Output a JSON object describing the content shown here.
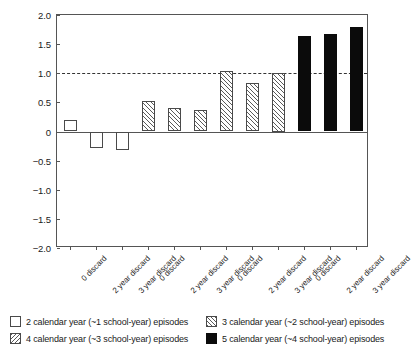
{
  "chart_data": {
    "type": "bar",
    "title": "",
    "subtitle": "",
    "xlabel": "",
    "ylabel": "",
    "ylim": [
      -2.0,
      2.0
    ],
    "ytick_labels": [
      "2.0",
      "1.5",
      "1.0",
      "0.5",
      "0",
      "-0.5",
      "-1.0",
      "-1.5",
      "-2.0"
    ],
    "ytick_values": [
      2.0,
      1.5,
      1.0,
      0.5,
      0,
      -0.5,
      -1.0,
      -1.5,
      -2.0
    ],
    "grid": false,
    "reference_line": {
      "value": 1.0,
      "style": "dashed",
      "color": "#333333"
    },
    "zero_line": {
      "value": 0,
      "style": "solid",
      "color": "#555555"
    },
    "legend_position": "below-plot",
    "categories": [
      "0 discard",
      "2 year discard",
      "3 year discard",
      "0 discard",
      "2 year discard",
      "3 year discard",
      "0 discard",
      "2 year discard",
      "3 year discard",
      "0 discard",
      "2 year discard",
      "3 year discard"
    ],
    "values": [
      0.19,
      -0.29,
      -0.31,
      0.52,
      0.4,
      0.37,
      1.04,
      0.83,
      1.0,
      1.64,
      1.68,
      1.79
    ],
    "bar_styles": [
      "empty",
      "empty",
      "empty",
      "hatch",
      "hatch",
      "hatch",
      "hatch",
      "hatch",
      "hatch",
      "solid",
      "solid",
      "solid"
    ],
    "groups": [
      {
        "name": "2 calendar year (~1 school-year) episodes",
        "style": "empty",
        "indices": [
          0,
          1,
          2
        ]
      },
      {
        "name": "3 calendar year (~2 school-year) episodes",
        "style": "hatch-up",
        "indices": [
          3,
          4,
          5
        ]
      },
      {
        "name": "4 calendar year (~3 school-year) episodes",
        "style": "hatch-down",
        "indices": [
          6,
          7,
          8
        ]
      },
      {
        "name": "5 calendar year (~4 school-year) episodes",
        "style": "solid",
        "indices": [
          9,
          10,
          11
        ]
      }
    ],
    "legend": [
      {
        "label": "2 calendar year (~1 school-year) episodes",
        "style": "empty"
      },
      {
        "label": "3 calendar year (~2 school-year) episodes",
        "style": "hatch-up"
      },
      {
        "label": "4 calendar year (~3 school-year) episodes",
        "style": "hatch-down"
      },
      {
        "label": "5 calendar year (~4 school-year) episodes",
        "style": "solid"
      }
    ],
    "colors": {
      "axis": "#555555",
      "bar_edge": "#4a4a4a",
      "bar_solid": "#0b0b0b",
      "hatch": "#5a5a5a",
      "background": "#ffffff",
      "text": "#1a1a1a"
    }
  }
}
